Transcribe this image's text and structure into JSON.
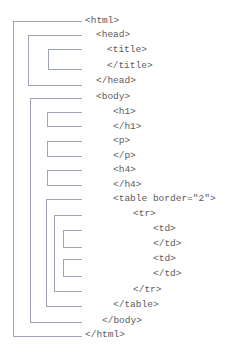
{
  "diagram": {
    "type": "html-document-tree",
    "tags": [
      {
        "id": "html-open",
        "text": "<html>",
        "x": 85,
        "y": 15
      },
      {
        "id": "head-open",
        "text": "<head>",
        "x": 96,
        "y": 29
      },
      {
        "id": "title-open",
        "text": "<title>",
        "x": 107,
        "y": 44
      },
      {
        "id": "title-close",
        "text": "</title>",
        "x": 107,
        "y": 60
      },
      {
        "id": "head-close",
        "text": "</head>",
        "x": 96,
        "y": 75
      },
      {
        "id": "body-open",
        "text": "<body>",
        "x": 96,
        "y": 91
      },
      {
        "id": "h1-open",
        "text": "<h1>",
        "x": 113,
        "y": 106
      },
      {
        "id": "h1-close",
        "text": "</h1>",
        "x": 113,
        "y": 121
      },
      {
        "id": "p-open",
        "text": "<p>",
        "x": 113,
        "y": 135
      },
      {
        "id": "p-close",
        "text": "</p>",
        "x": 113,
        "y": 150
      },
      {
        "id": "h4-open",
        "text": "<h4>",
        "x": 113,
        "y": 164
      },
      {
        "id": "h4-close",
        "text": "</h4>",
        "x": 113,
        "y": 179
      },
      {
        "id": "table-open",
        "text": "<table border=\"2\">",
        "x": 113,
        "y": 193
      },
      {
        "id": "tr-open",
        "text": "<tr>",
        "x": 133,
        "y": 208
      },
      {
        "id": "td1-open",
        "text": "<td>",
        "x": 153,
        "y": 223
      },
      {
        "id": "td1-close",
        "text": "</td>",
        "x": 153,
        "y": 238
      },
      {
        "id": "td2-open",
        "text": "<td>",
        "x": 153,
        "y": 253
      },
      {
        "id": "td2-close",
        "text": "</td>",
        "x": 153,
        "y": 268
      },
      {
        "id": "tr-close",
        "text": "</tr>",
        "x": 133,
        "y": 284
      },
      {
        "id": "table-close",
        "text": "</table>",
        "x": 113,
        "y": 299
      },
      {
        "id": "body-close",
        "text": "</body>",
        "x": 102,
        "y": 315
      },
      {
        "id": "html-close",
        "text": "</html>",
        "x": 85,
        "y": 329
      }
    ],
    "brackets": [
      {
        "id": "html",
        "left": 13,
        "top": 21,
        "bottom": 336
      },
      {
        "id": "head",
        "left": 28,
        "top": 35,
        "bottom": 85
      },
      {
        "id": "title",
        "left": 48,
        "top": 50,
        "bottom": 69
      },
      {
        "id": "body",
        "left": 30,
        "top": 98,
        "bottom": 322
      },
      {
        "id": "h1",
        "left": 47,
        "top": 112,
        "bottom": 126
      },
      {
        "id": "p",
        "left": 47,
        "top": 141,
        "bottom": 156
      },
      {
        "id": "h4",
        "left": 47,
        "top": 170,
        "bottom": 185
      },
      {
        "id": "table",
        "left": 46,
        "top": 200,
        "bottom": 306
      },
      {
        "id": "tr",
        "left": 54,
        "top": 215,
        "bottom": 291
      },
      {
        "id": "td1",
        "left": 63,
        "top": 230,
        "bottom": 247
      },
      {
        "id": "td2",
        "left": 63,
        "top": 259,
        "bottom": 276
      }
    ],
    "line_right_edge": 82,
    "colors": {
      "line": "#9ea6b6",
      "text": "#5b5b5b",
      "background": "#ffffff"
    }
  }
}
